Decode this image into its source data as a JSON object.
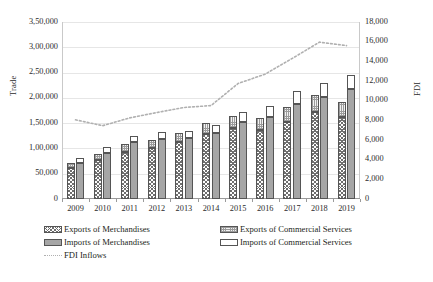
{
  "chart_data": {
    "type": "bar",
    "title": "",
    "xlabel": "",
    "ylabel": "Trade",
    "y2label": "FDI",
    "categories": [
      "2009",
      "2010",
      "2011",
      "2012",
      "2013",
      "2014",
      "2015",
      "2016",
      "2017",
      "2018",
      "2019"
    ],
    "ylim": [
      0,
      350000
    ],
    "y2lim": [
      0,
      18000
    ],
    "grid": true,
    "legend_position": "bottom",
    "y_ticklabels": [
      "3,50,000",
      "3,00,000",
      "2,50,000",
      "2,00,000",
      "1,50,000",
      "1,00,000",
      "50,000",
      "0"
    ],
    "y_tickvalues": [
      350000,
      300000,
      250000,
      200000,
      150000,
      100000,
      50000,
      0
    ],
    "y2_ticklabels": [
      "18,000",
      "16,000",
      "14,000",
      "12,000",
      "10,000",
      "8,000",
      "6,000",
      "4,000",
      "2,000",
      "0"
    ],
    "y2_tickvalues": [
      18000,
      16000,
      14000,
      12000,
      10000,
      8000,
      6000,
      4000,
      2000,
      0
    ],
    "series": [
      {
        "name": "Exports of Merchandises",
        "axis": "left",
        "stack": "exports",
        "values": [
          62000,
          78000,
          93000,
          100000,
          112000,
          128000,
          140000,
          137000,
          152000,
          172000,
          162000
        ]
      },
      {
        "name": "Exports of Commercial Services",
        "axis": "left",
        "stack": "exports",
        "values": [
          10000,
          12000,
          16000,
          17000,
          19000,
          22000,
          25000,
          24000,
          29000,
          33000,
          30000
        ]
      },
      {
        "name": "Imports of Merchandises",
        "axis": "left",
        "stack": "imports",
        "values": [
          72000,
          92000,
          112000,
          118000,
          120000,
          130000,
          152000,
          163000,
          188000,
          202000,
          218000
        ]
      },
      {
        "name": "Imports of Commercial Services",
        "axis": "left",
        "stack": "imports",
        "values": [
          9000,
          11000,
          13000,
          14000,
          15000,
          17000,
          20000,
          22000,
          26000,
          28000,
          27000
        ]
      },
      {
        "name": "FDI Inflows",
        "axis": "right",
        "type": "line",
        "style": "dotted",
        "values": [
          8050,
          7450,
          8250,
          8800,
          9300,
          9500,
          11750,
          12700,
          14300,
          15950,
          15600
        ]
      }
    ]
  },
  "axes": {
    "left_title": "Trade",
    "right_title": "FDI"
  },
  "legend": {
    "items": [
      {
        "label": "Exports of Merchandises",
        "marker": "hatch-swatch"
      },
      {
        "label": "Exports of Commercial Services",
        "marker": "speckle-swatch"
      },
      {
        "label": "Imports of Merchandises",
        "marker": "grey-swatch"
      },
      {
        "label": "Imports of Commercial Services",
        "marker": "white-swatch"
      },
      {
        "label": "FDI Inflows",
        "marker": "dotted-line-swatch"
      }
    ]
  },
  "colors": {
    "grid": "#e6e6e6",
    "axis": "#9a9a9a",
    "imports_merch": "#a6a6a6",
    "imports_serv": "#ffffff",
    "fdi_line": "#b0b0b0",
    "text": "#231f20"
  }
}
